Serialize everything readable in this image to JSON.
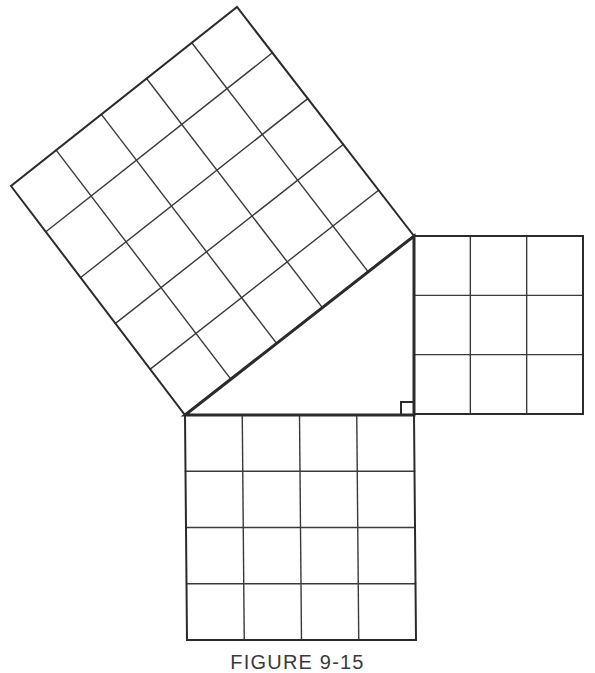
{
  "figure": {
    "caption": "FIGURE 9-15",
    "caption_clipped": true,
    "background_color": "#ffffff",
    "line_color": "#2b2b2b",
    "grid_line_color": "#3a3a3a",
    "outline_width": 3,
    "grid_width": 1.4,
    "triangle": {
      "name": "right-triangle",
      "vertices": [
        [
          185,
          415
        ],
        [
          414,
          415
        ],
        [
          414,
          236
        ]
      ],
      "right_angle_at": [
        414,
        415
      ],
      "right_angle_marker_size": 13,
      "leg_horizontal_length_units": 4,
      "leg_vertical_length_units": 3,
      "hypotenuse_length_units": 5
    },
    "squares": [
      {
        "name": "square-on-horizontal-leg",
        "position": "bottom",
        "grid": 4,
        "cells": 16,
        "corners": [
          [
            185,
            415
          ],
          [
            414,
            415
          ],
          [
            416,
            640
          ],
          [
            187,
            640
          ]
        ]
      },
      {
        "name": "square-on-vertical-leg",
        "position": "right",
        "grid": 3,
        "cells": 9,
        "corners": [
          [
            414,
            236
          ],
          [
            583,
            236
          ],
          [
            583,
            414
          ],
          [
            414,
            414
          ]
        ]
      },
      {
        "name": "square-on-hypotenuse",
        "position": "upper-left-tilted",
        "grid": 5,
        "cells": 25,
        "corners": [
          [
            185,
            415
          ],
          [
            414,
            236
          ],
          [
            237,
            7
          ],
          [
            11,
            186
          ]
        ]
      }
    ],
    "relation": {
      "statement": "9 + 16 = 25",
      "a_squared_cells": 9,
      "b_squared_cells": 16,
      "c_squared_cells": 25
    }
  }
}
